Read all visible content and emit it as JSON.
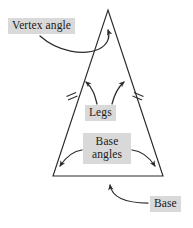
{
  "figure": {
    "shape": "isosceles-triangle",
    "stroke_color": "#2b2b2b",
    "label_background": "#d9d9d9",
    "label_text_color": "#1a1a1a",
    "page_background": "#ffffff"
  },
  "labels": {
    "vertex_angle": "Vertex angle",
    "legs": "Legs",
    "base_angles_line1": "Base",
    "base_angles_line2": "angles",
    "base": "Base"
  },
  "annotations": {
    "tick_marks": 2,
    "tick_mark_meaning": "congruent legs",
    "arrows": [
      {
        "from": "Vertex angle",
        "to": "apex-interior-angle"
      },
      {
        "from": "Legs",
        "to": "left-leg"
      },
      {
        "from": "Legs",
        "to": "right-leg"
      },
      {
        "from": "Base angles",
        "to": "bottom-left-angle"
      },
      {
        "from": "Base angles",
        "to": "bottom-right-angle"
      },
      {
        "from": "Base",
        "to": "bottom-edge"
      }
    ]
  },
  "geometry": {
    "apex": [
      108,
      10
    ],
    "bottom_left": [
      53,
      176
    ],
    "bottom_right": [
      163,
      176
    ]
  }
}
